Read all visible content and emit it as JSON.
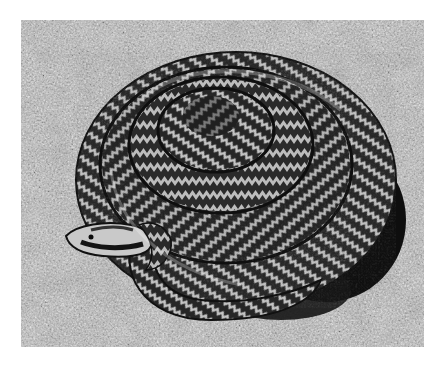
{
  "image": {
    "subject": "coiled adder snake on granite rock",
    "style": "black-and-white photograph",
    "colors": {
      "background": "#ffffff",
      "rock_light": "#d2d2d2",
      "rock_mid": "#9a9a9a",
      "rock_dark": "#555555",
      "snake_dark": "#1a1a1a",
      "snake_light": "#bdbdbd",
      "shadow": "#0d0d0d"
    }
  }
}
